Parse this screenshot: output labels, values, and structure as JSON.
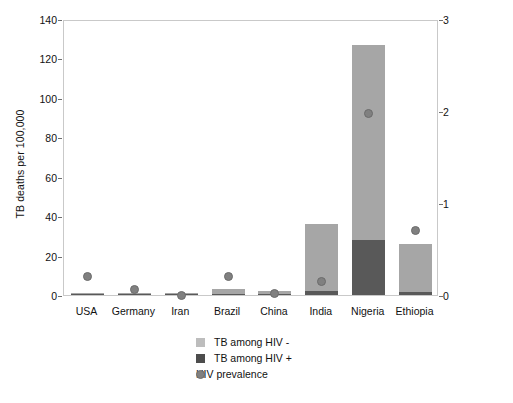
{
  "chart_data": {
    "type": "bar",
    "title": "",
    "categories": [
      "USA",
      "Germany",
      "Iran",
      "Brazil",
      "China",
      "India",
      "Nigeria",
      "Ethiopia"
    ],
    "series": [
      {
        "name": "TB among HIV +",
        "axis": "left",
        "color": "#595959",
        "values": [
          0.1,
          0.1,
          0.1,
          0.2,
          0.1,
          1.8,
          28,
          1.5
        ]
      },
      {
        "name": "TB among HIV -",
        "axis": "left",
        "color": "#a6a6a6",
        "values": [
          0.2,
          0.4,
          0.4,
          2.3,
          1.2,
          34,
          99,
          24.5
        ]
      },
      {
        "name": "HIV prevalence",
        "axis": "right",
        "type": "scatter",
        "color": "#808080",
        "values": [
          0.22,
          0.08,
          0.02,
          0.22,
          0.04,
          0.17,
          2.0,
          0.72
        ]
      }
    ],
    "totals_left": [
      0.3,
      0.5,
      0.5,
      2.5,
      1.3,
      35.8,
      127,
      26
    ],
    "ylabel_left": "TB deaths per 100,000",
    "ylabel_right": "HIV prevalence (%)",
    "xlabel": "",
    "ylim_left": [
      0,
      140
    ],
    "ylim_right": [
      0,
      3
    ],
    "yticks_left": [
      "140",
      "120",
      "100",
      "80",
      "60",
      "40",
      "20",
      "0"
    ],
    "yticks_right": [
      "3",
      "2",
      "1",
      "0"
    ],
    "grid": false,
    "legend_position": "bottom-center",
    "legend": [
      {
        "label": "TB among HIV -",
        "marker": "square",
        "color": "#bdbdbd"
      },
      {
        "label": "TB among HIV +",
        "marker": "square",
        "color": "#4d4d4d"
      },
      {
        "label": "HIV prevalence",
        "marker": "circle",
        "color": "#808080"
      }
    ]
  }
}
